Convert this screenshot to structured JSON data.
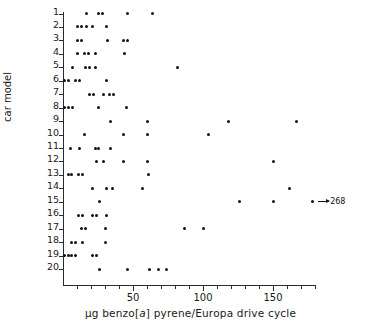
{
  "chart_data": {
    "type": "scatter",
    "title": "",
    "xlabel": "µg benzo[a] pyrene/Europa drive cycle",
    "xlabel_parts": {
      "before": "µg benzo[",
      "italic": "a",
      "after": "] pyrene/Europa drive  cycle"
    },
    "ylabel": "car model",
    "xlim": [
      0,
      180
    ],
    "ylim_categories": [
      "1",
      "2",
      "3",
      "4",
      "5",
      "6",
      "7",
      "8",
      "9",
      "10",
      "11",
      "12",
      "13",
      "14",
      "15",
      "16",
      "17",
      "18",
      "19",
      "20"
    ],
    "xticks_major": [
      50,
      100,
      150
    ],
    "xtick_labels": [
      "50",
      "100",
      "150"
    ],
    "xticks_minor": [
      10,
      20,
      30,
      40,
      60,
      70,
      80,
      90,
      110,
      120,
      130,
      140,
      160,
      170,
      180
    ],
    "grid": false,
    "legend": null,
    "marker_color": "#111111",
    "axis_color": "#2b2b2b",
    "annotations": [
      {
        "car_model": "15",
        "x_plot": 178,
        "value": "268",
        "arrow": "right",
        "note": "off-scale point drawn at right edge with arrow to 268"
      }
    ],
    "series": [
      {
        "name": "car model 1",
        "row": 1,
        "values": [
          17,
          25,
          28,
          46,
          64
        ]
      },
      {
        "name": "car model 2",
        "row": 2,
        "values": [
          10,
          13,
          17,
          21,
          31
        ]
      },
      {
        "name": "car model 3",
        "row": 3,
        "values": [
          10,
          13,
          32,
          43,
          46
        ]
      },
      {
        "name": "car model 4",
        "row": 4,
        "values": [
          10,
          15,
          18,
          23,
          44
        ]
      },
      {
        "name": "car model 5",
        "row": 5,
        "values": [
          7,
          16,
          19,
          23,
          82
        ]
      },
      {
        "name": "car model 6",
        "row": 6,
        "values": [
          1,
          4,
          9,
          12,
          31
        ]
      },
      {
        "name": "car model 7",
        "row": 7,
        "values": [
          19,
          22,
          29,
          33,
          36
        ]
      },
      {
        "name": "car model 8",
        "row": 8,
        "values": [
          1,
          4,
          7,
          25,
          45
        ]
      },
      {
        "name": "car model 9",
        "row": 9,
        "values": [
          34,
          60,
          118,
          167
        ]
      },
      {
        "name": "car model 10",
        "row": 10,
        "values": [
          15,
          43,
          60,
          104
        ]
      },
      {
        "name": "car model 11",
        "row": 11,
        "values": [
          5,
          12,
          23,
          25,
          34
        ]
      },
      {
        "name": "car model 12",
        "row": 12,
        "values": [
          24,
          29,
          43,
          60,
          150
        ]
      },
      {
        "name": "car model 13",
        "row": 13,
        "values": [
          4,
          6,
          11,
          14,
          61
        ]
      },
      {
        "name": "car model 14",
        "row": 14,
        "values": [
          21,
          31,
          35,
          57,
          162
        ]
      },
      {
        "name": "car model 15",
        "row": 15,
        "values": [
          26,
          126,
          150,
          178
        ]
      },
      {
        "name": "car model 16",
        "row": 16,
        "values": [
          11,
          14,
          21,
          24,
          31
        ]
      },
      {
        "name": "car model 17",
        "row": 17,
        "values": [
          13,
          16,
          30,
          87,
          100
        ]
      },
      {
        "name": "car model 18",
        "row": 18,
        "values": [
          6,
          9,
          14,
          30
        ]
      },
      {
        "name": "car model 19",
        "row": 19,
        "values": [
          1,
          4,
          6,
          9,
          21,
          24
        ]
      },
      {
        "name": "car model 20",
        "row": 20,
        "values": [
          26,
          46,
          62,
          68,
          74
        ]
      }
    ]
  }
}
